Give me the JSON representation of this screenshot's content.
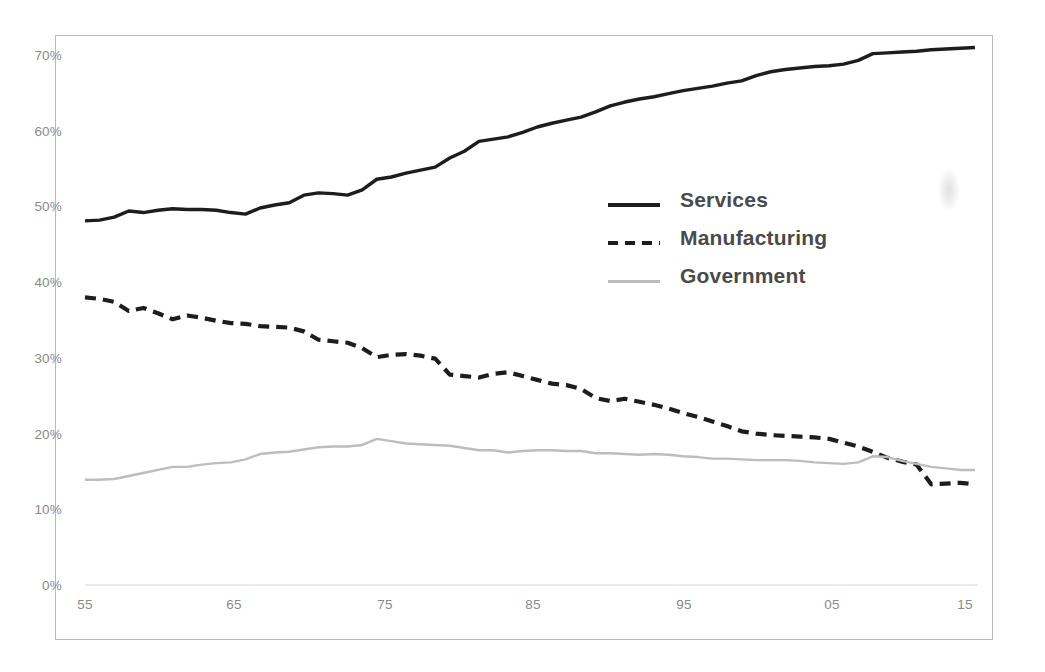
{
  "chart_data": {
    "type": "line",
    "title": "",
    "subtitle": "",
    "xlabel": "",
    "ylabel": "",
    "xlim": [
      1955,
      2016
    ],
    "ylim": [
      0,
      75
    ],
    "grid": false,
    "legend_position": "center-right",
    "y_ticks": [
      "0%",
      "10%",
      "20%",
      "30%",
      "40%",
      "50%",
      "60%",
      "70%"
    ],
    "y_tick_values": [
      0,
      10,
      20,
      30,
      40,
      50,
      60,
      70
    ],
    "x_ticks": [
      "55",
      "65",
      "75",
      "85",
      "95",
      "05",
      "15"
    ],
    "x_tick_values": [
      1955,
      1965,
      1975,
      1985,
      1995,
      2005,
      2015
    ],
    "x": [
      1955,
      1956,
      1957,
      1958,
      1959,
      1960,
      1961,
      1962,
      1963,
      1964,
      1965,
      1966,
      1967,
      1968,
      1969,
      1970,
      1971,
      1972,
      1973,
      1974,
      1975,
      1976,
      1977,
      1978,
      1979,
      1980,
      1981,
      1982,
      1983,
      1984,
      1985,
      1986,
      1987,
      1988,
      1989,
      1990,
      1991,
      1992,
      1993,
      1994,
      1995,
      1996,
      1997,
      1998,
      1999,
      2000,
      2001,
      2002,
      2003,
      2004,
      2005,
      2006,
      2007,
      2008,
      2009,
      2010,
      2011,
      2012,
      2013,
      2014,
      2015,
      2016
    ],
    "series": [
      {
        "name": "Services",
        "style": "solid",
        "color": "#1d1d1d",
        "values": [
          48.1,
          48.2,
          48.6,
          49.4,
          49.2,
          49.5,
          49.7,
          49.6,
          49.6,
          49.5,
          49.2,
          49.0,
          49.8,
          50.2,
          50.5,
          51.5,
          51.8,
          51.7,
          51.5,
          52.2,
          53.6,
          53.9,
          54.4,
          54.8,
          55.2,
          56.4,
          57.3,
          58.6,
          58.9,
          59.2,
          59.8,
          60.5,
          61.0,
          61.4,
          61.8,
          62.5,
          63.3,
          63.8,
          64.2,
          64.5,
          64.9,
          65.3,
          65.6,
          65.9,
          66.3,
          66.6,
          67.3,
          67.8,
          68.1,
          68.3,
          68.5,
          68.6,
          68.8,
          69.3,
          70.2,
          70.3,
          70.4,
          70.5,
          70.7,
          70.8,
          70.9,
          71.0
        ]
      },
      {
        "name": "Manufacturing",
        "style": "dashed",
        "color": "#1d1d1d",
        "values": [
          38.0,
          37.8,
          37.4,
          36.2,
          36.6,
          35.9,
          35.1,
          35.6,
          35.3,
          34.9,
          34.6,
          34.5,
          34.2,
          34.1,
          34.0,
          33.5,
          32.4,
          32.2,
          32.0,
          31.3,
          30.1,
          30.4,
          30.5,
          30.3,
          29.9,
          27.8,
          27.6,
          27.4,
          27.9,
          28.1,
          27.6,
          27.1,
          26.6,
          26.4,
          25.9,
          24.7,
          24.3,
          24.6,
          24.2,
          23.8,
          23.3,
          22.7,
          22.2,
          21.6,
          21.0,
          20.3,
          20.0,
          19.8,
          19.7,
          19.6,
          19.5,
          19.3,
          18.8,
          18.3,
          17.6,
          16.8,
          16.3,
          15.9,
          13.3,
          13.4,
          13.5,
          13.3
        ]
      },
      {
        "name": "Government",
        "style": "solid-light",
        "color": "#bdbdbd",
        "values": [
          13.9,
          13.9,
          14.0,
          14.4,
          14.8,
          15.2,
          15.6,
          15.6,
          15.9,
          16.1,
          16.2,
          16.6,
          17.3,
          17.5,
          17.6,
          17.9,
          18.2,
          18.3,
          18.3,
          18.5,
          19.3,
          19.0,
          18.7,
          18.6,
          18.5,
          18.4,
          18.1,
          17.8,
          17.8,
          17.5,
          17.7,
          17.8,
          17.8,
          17.7,
          17.7,
          17.4,
          17.4,
          17.3,
          17.2,
          17.3,
          17.2,
          17.0,
          16.9,
          16.7,
          16.7,
          16.6,
          16.5,
          16.5,
          16.5,
          16.4,
          16.2,
          16.1,
          16.0,
          16.2,
          17.0,
          16.9,
          16.4,
          16.0,
          15.6,
          15.4,
          15.2,
          15.2
        ]
      }
    ]
  }
}
